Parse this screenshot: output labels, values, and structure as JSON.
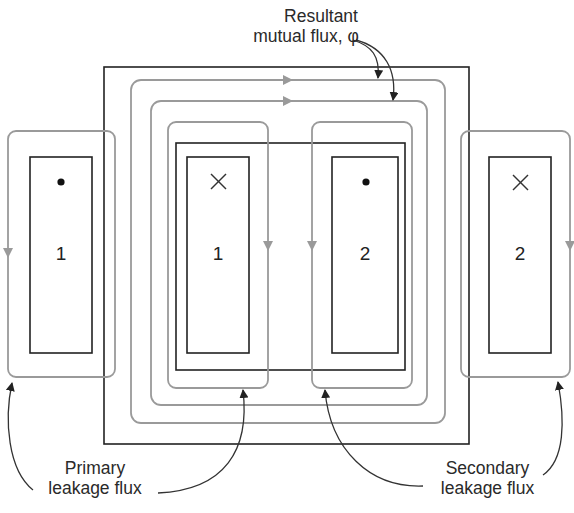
{
  "diagram": {
    "type": "transformer-leakage-flux",
    "labels": {
      "mutual_flux_line1": "Resultant",
      "mutual_flux_line2": "mutual flux, φ",
      "primary_line1": "Primary",
      "primary_line2": "leakage flux",
      "secondary_line1": "Secondary",
      "secondary_line2": "leakage flux"
    },
    "coils": [
      {
        "id": "primary-outer",
        "number": "1",
        "polarity": "dot",
        "polarity_symbol": "•"
      },
      {
        "id": "primary-inner",
        "number": "1",
        "polarity": "cross",
        "polarity_symbol": "×"
      },
      {
        "id": "secondary-inner",
        "number": "2",
        "polarity": "dot",
        "polarity_symbol": "•"
      },
      {
        "id": "secondary-outer",
        "number": "2",
        "polarity": "cross",
        "polarity_symbol": "×"
      }
    ],
    "colors": {
      "core_line": "#222222",
      "flux_line": "#9a9a9a",
      "text": "#2a2a2a",
      "background": "#ffffff"
    }
  }
}
